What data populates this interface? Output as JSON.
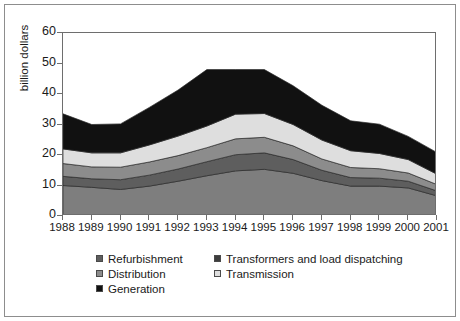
{
  "chart_data": {
    "type": "area",
    "stacked": true,
    "title": "",
    "subtitle": "",
    "xlabel": "",
    "ylabel": "billion dollars",
    "xlim": [
      1988,
      2001
    ],
    "ylim": [
      0,
      60
    ],
    "ytick_step": 10,
    "yticks": [
      0,
      10,
      20,
      30,
      40,
      50,
      60
    ],
    "grid": false,
    "legend_position": "bottom",
    "x": [
      1988,
      1989,
      1990,
      1991,
      1992,
      1993,
      1994,
      1995,
      1996,
      1997,
      1998,
      1999,
      2000,
      2001
    ],
    "categories": [
      "1988",
      "1989",
      "1990",
      "1991",
      "1992",
      "1993",
      "1994",
      "1995",
      "1996",
      "1997",
      "1998",
      "1999",
      "2000",
      "2001"
    ],
    "stack_order_bottom_to_top": [
      "Generation",
      "Refurbishment",
      "Distribution",
      "Transmission",
      "Transformers and load dispatching"
    ],
    "series": [
      {
        "name": "Generation",
        "color": "#7e7e7e",
        "values": [
          10.0,
          9.4,
          8.7,
          9.8,
          11.4,
          13.2,
          14.8,
          15.3,
          14.0,
          11.6,
          9.8,
          9.8,
          9.2,
          6.6
        ]
      },
      {
        "name": "Refurbishment",
        "color": "#5e5e5e",
        "values": [
          3.0,
          2.8,
          3.2,
          3.6,
          4.0,
          4.6,
          5.3,
          5.4,
          4.5,
          3.4,
          2.8,
          2.6,
          2.2,
          1.6
        ]
      },
      {
        "name": "Distribution",
        "color": "#8c8c8c",
        "values": [
          4.2,
          3.9,
          4.1,
          4.3,
          4.4,
          4.6,
          5.2,
          5.1,
          4.5,
          3.7,
          3.3,
          3.1,
          2.7,
          2.1
        ]
      },
      {
        "name": "Transmission",
        "color": "#dedede",
        "values": [
          4.8,
          4.6,
          4.7,
          5.6,
          6.4,
          7.1,
          8.1,
          7.8,
          7.0,
          6.2,
          5.5,
          5.0,
          4.4,
          3.4
        ]
      },
      {
        "name": "Transformers and load dispatching",
        "color": "#111111",
        "values": [
          11.5,
          9.3,
          9.5,
          12.3,
          15.1,
          18.5,
          14.6,
          14.4,
          12.7,
          11.4,
          9.8,
          9.6,
          7.6,
          7.1
        ]
      }
    ],
    "series_totals": [
      33.5,
      30.0,
      30.2,
      35.6,
      41.3,
      48.0,
      48.0,
      48.0,
      42.7,
      36.3,
      31.2,
      30.1,
      26.1,
      20.8
    ]
  },
  "axes": {
    "y_title": "billion dollars",
    "y_tick_labels": [
      "60",
      "50",
      "40",
      "30",
      "20",
      "10",
      "0"
    ],
    "x_tick_labels": [
      "1988",
      "1989",
      "1990",
      "1991",
      "1992",
      "1993",
      "1994",
      "1995",
      "1996",
      "1997",
      "1998",
      "1999",
      "2000",
      "2001"
    ]
  },
  "legend": {
    "column_1": [
      {
        "label": "Refurbishment",
        "color": "#5e5e5e"
      },
      {
        "label": "Distribution",
        "color": "#8c8c8c"
      },
      {
        "label": "Generation",
        "color": "#111111"
      }
    ],
    "column_2": [
      {
        "label": "Transformers and load dispatching",
        "color": "#3d3d3d"
      },
      {
        "label": "Transmission",
        "color": "#dedede"
      }
    ]
  },
  "colors": {
    "frame": "#8d8d8d",
    "axis": "#6e6e6e",
    "text": "#1a1a1a",
    "background": "#ffffff"
  }
}
